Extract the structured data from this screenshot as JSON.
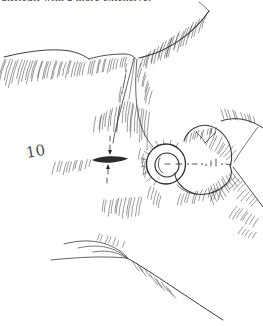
{
  "illustration": {
    "caption_fragment": "difficult with a more extensive.",
    "label": "10"
  },
  "colors": {
    "ink": "#2b2b2b",
    "background": "#ffffff"
  }
}
